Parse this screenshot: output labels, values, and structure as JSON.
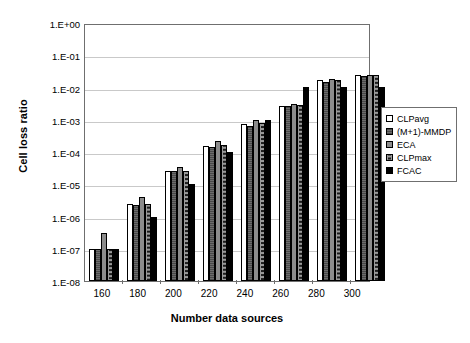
{
  "chart_data": {
    "type": "bar",
    "title": "",
    "xlabel": "Number data sources",
    "ylabel": "Cell loss ratio",
    "categories": [
      "160",
      "180",
      "200",
      "220",
      "240",
      "260",
      "280",
      "300"
    ],
    "yscale": "log",
    "ylim": [
      1e-08,
      1
    ],
    "ytick_labels": [
      "1.E+00",
      "1.E-01",
      "1.E-02",
      "1.E-03",
      "1.E-04",
      "1.E-05",
      "1.E-06",
      "1.E-07",
      "1.E-08"
    ],
    "ytick_values": [
      1,
      0.1,
      0.01,
      0.001,
      0.0001,
      1e-05,
      1e-06,
      1e-07,
      1e-08
    ],
    "grid": true,
    "legend_position": "right",
    "series": [
      {
        "name": "CLPavg",
        "fill": "white",
        "values": [
          1e-07,
          2.5e-06,
          2.6e-05,
          0.00015,
          0.00075,
          0.0027,
          0.017,
          0.024
        ]
      },
      {
        "name": "(M+1)-MMDP",
        "fill": "dark-gray-striped",
        "values": [
          1e-07,
          2.2e-06,
          2.5e-05,
          0.00014,
          0.00065,
          0.0027,
          0.015,
          0.023
        ]
      },
      {
        "name": "ECA",
        "fill": "gray",
        "values": [
          3e-07,
          4e-06,
          3.5e-05,
          0.00022,
          0.00095,
          0.003,
          0.018,
          0.024
        ]
      },
      {
        "name": "CLPmax",
        "fill": "gray-dotted",
        "values": [
          1e-07,
          2.5e-06,
          2.6e-05,
          0.00016,
          0.0008,
          0.0028,
          0.017,
          0.024
        ]
      },
      {
        "name": "FCAC",
        "fill": "black",
        "values": [
          1e-07,
          1e-06,
          1e-05,
          0.0001,
          0.001,
          0.0105,
          0.0105,
          0.0105
        ]
      }
    ]
  },
  "legend": {
    "items": [
      {
        "label": "CLPavg",
        "swatch": "white"
      },
      {
        "label": "(M+1)-MMDP",
        "swatch": "dark-gray-striped"
      },
      {
        "label": "ECA",
        "swatch": "gray"
      },
      {
        "label": "CLPmax",
        "swatch": "gray-dotted"
      },
      {
        "label": "FCAC",
        "swatch": "black"
      }
    ]
  }
}
